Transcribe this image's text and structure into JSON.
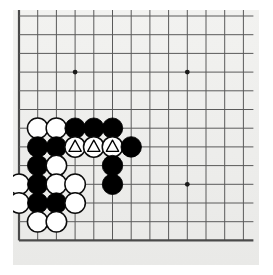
{
  "app": {
    "title": "Go Board Diagram",
    "board_label": "go-board"
  },
  "board": {
    "background_color": "#eeeeee",
    "line_color": "#5a5a5a",
    "edge_color": "#4a4a4a",
    "black_color": "#000000",
    "white_color": "#ffffff",
    "mark_color": "#000000",
    "columns": 13,
    "rows": 13,
    "spacing": 18.7,
    "origin_x": 6,
    "origin_y": 6,
    "star_points": [
      {
        "col": 4,
        "row": 4
      },
      {
        "col": 10,
        "row": 4
      },
      {
        "col": 10,
        "row": 10
      }
    ],
    "stones": [
      {
        "col": 2,
        "row": 7,
        "color": "white",
        "mark": "none"
      },
      {
        "col": 3,
        "row": 7,
        "color": "white",
        "mark": "none"
      },
      {
        "col": 4,
        "row": 7,
        "color": "black",
        "mark": "none"
      },
      {
        "col": 5,
        "row": 7,
        "color": "black",
        "mark": "none"
      },
      {
        "col": 6,
        "row": 7,
        "color": "black",
        "mark": "none"
      },
      {
        "col": 2,
        "row": 8,
        "color": "black",
        "mark": "none"
      },
      {
        "col": 3,
        "row": 8,
        "color": "black",
        "mark": "none"
      },
      {
        "col": 4,
        "row": 8,
        "color": "white",
        "mark": "triangle"
      },
      {
        "col": 5,
        "row": 8,
        "color": "white",
        "mark": "triangle"
      },
      {
        "col": 6,
        "row": 8,
        "color": "white",
        "mark": "triangle"
      },
      {
        "col": 7,
        "row": 8,
        "color": "black",
        "mark": "none"
      },
      {
        "col": 2,
        "row": 9,
        "color": "black",
        "mark": "none"
      },
      {
        "col": 3,
        "row": 9,
        "color": "white",
        "mark": "none"
      },
      {
        "col": 6,
        "row": 9,
        "color": "black",
        "mark": "none"
      },
      {
        "col": 1,
        "row": 10,
        "color": "white",
        "mark": "none"
      },
      {
        "col": 2,
        "row": 10,
        "color": "black",
        "mark": "none"
      },
      {
        "col": 3,
        "row": 10,
        "color": "white",
        "mark": "none"
      },
      {
        "col": 4,
        "row": 10,
        "color": "white",
        "mark": "none"
      },
      {
        "col": 6,
        "row": 10,
        "color": "black",
        "mark": "none"
      },
      {
        "col": 1,
        "row": 11,
        "color": "white",
        "mark": "none"
      },
      {
        "col": 2,
        "row": 11,
        "color": "black",
        "mark": "none"
      },
      {
        "col": 3,
        "row": 11,
        "color": "black",
        "mark": "none"
      },
      {
        "col": 4,
        "row": 11,
        "color": "white",
        "mark": "none"
      },
      {
        "col": 2,
        "row": 12,
        "color": "white",
        "mark": "none"
      },
      {
        "col": 3,
        "row": 12,
        "color": "white",
        "mark": "none"
      }
    ],
    "counts": {
      "black_stones": 13,
      "white_stones": 12,
      "marked_stones": 3
    }
  }
}
